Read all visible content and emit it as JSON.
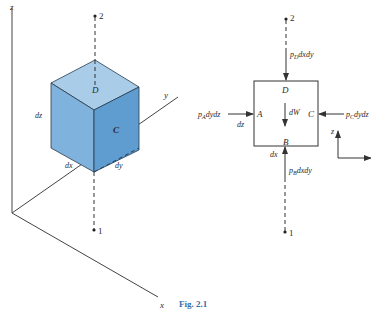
{
  "figure": {
    "caption": "Fig. 2.1",
    "colors": {
      "cube_top": "#a9cde8",
      "cube_left": "#7fb2dc",
      "cube_right": "#5f9ccf",
      "edge": "#2a3a4a",
      "line": "#333333",
      "caption": "#3a6fa8"
    }
  },
  "left_panel": {
    "axes": {
      "z": "z",
      "y": "y",
      "x": "x"
    },
    "cube": {
      "face_top": "D",
      "face_right": "C",
      "edge_z": "dz",
      "edge_x": "dx",
      "edge_y": "dy"
    },
    "points": {
      "top": "2",
      "bottom": "1"
    }
  },
  "right_panel": {
    "faces": {
      "top": "D",
      "bottom": "B",
      "left": "A",
      "right": "C"
    },
    "weight": "dW",
    "forces": {
      "top": {
        "p": "p",
        "sub": "D",
        "rest": "dxdy"
      },
      "bottom": {
        "p": "p",
        "sub": "B",
        "rest": "dxdy"
      },
      "left": {
        "p": "p",
        "sub": "A",
        "rest": "dydz"
      },
      "right": {
        "p": "p",
        "sub": "C",
        "rest": "dydz"
      }
    },
    "dims": {
      "height": "dz",
      "width": "dx"
    },
    "axes": {
      "z": "z"
    },
    "points": {
      "top": "2",
      "bottom": "1"
    }
  }
}
